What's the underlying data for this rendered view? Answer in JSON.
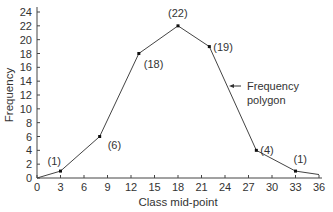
{
  "chart_data": {
    "type": "line",
    "title": "",
    "xlabel": "Class mid-point",
    "ylabel": "Frequency",
    "xlim": [
      0,
      36
    ],
    "ylim": [
      0,
      24
    ],
    "x_ticks": [
      0,
      3,
      6,
      9,
      12,
      15,
      18,
      21,
      24,
      27,
      30,
      33,
      36
    ],
    "y_ticks": [
      0,
      2,
      4,
      6,
      8,
      10,
      12,
      14,
      16,
      18,
      20,
      22,
      24
    ],
    "grid": false,
    "series": [
      {
        "name": "Frequency polygon",
        "x": [
          0,
          3,
          8,
          13,
          18,
          22,
          28,
          33,
          36
        ],
        "y": [
          0,
          1,
          6,
          18,
          22,
          19,
          4,
          1,
          0.5
        ]
      }
    ],
    "point_labels": [
      {
        "x": 3,
        "y": 1,
        "label": "(1)"
      },
      {
        "x": 8,
        "y": 6,
        "label": "(6)"
      },
      {
        "x": 13,
        "y": 18,
        "label": "(18)"
      },
      {
        "x": 18,
        "y": 22,
        "label": "(22)"
      },
      {
        "x": 22,
        "y": 19,
        "label": "(19)"
      },
      {
        "x": 28,
        "y": 4,
        "label": "(4)"
      },
      {
        "x": 33,
        "y": 1,
        "label": "(1)"
      }
    ],
    "annotations": [
      {
        "text_line1": "Frequency",
        "text_line2": "polygon",
        "points_to": "line segment between (22,19) and (28,4)"
      }
    ]
  }
}
